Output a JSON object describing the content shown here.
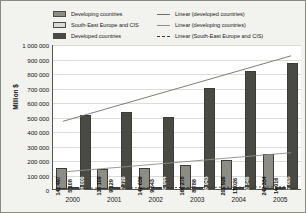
{
  "legend": {
    "left_items": [
      {
        "label": "Developing countries",
        "swatch": "bar-swatch-developing",
        "color": "#8d8d86"
      },
      {
        "label": "South-East Europe and CIS",
        "swatch": "bar-swatch-see-cis",
        "color": "#d9d9d2"
      },
      {
        "label": "Developed countries",
        "swatch": "bar-swatch-developed",
        "color": "#4a4a45"
      }
    ],
    "right_items": [
      {
        "label": "Linear (developed countries)",
        "swatch": "line-swatch-developed",
        "style": "solid",
        "color": "#6e6e68"
      },
      {
        "label": "Linear (developing countries)",
        "swatch": "line-swatch-developing",
        "style": "solid",
        "color": "#8d8d86"
      },
      {
        "label": "Linear (South-East Europe and CIS)",
        "swatch": "line-swatch-see-cis",
        "style": "dashed",
        "color": "#3a3a36"
      }
    ]
  },
  "chart_data": {
    "type": "bar",
    "title": "",
    "xlabel": "",
    "ylabel": "Million $",
    "categories": [
      "2000",
      "2001",
      "2002",
      "2003",
      "2004",
      "2005"
    ],
    "ylim": [
      0,
      1000000
    ],
    "ytick_labels": [
      "1 000 000",
      "900 000",
      "800 000",
      "700 000",
      "600 000",
      "500 000",
      "400 000",
      "300 000",
      "200 000",
      "100 000",
      "0"
    ],
    "ytick_values": [
      1000000,
      900000,
      800000,
      700000,
      600000,
      500000,
      400000,
      300000,
      200000,
      100000,
      0
    ],
    "grid": true,
    "legend_position": "top",
    "series": [
      {
        "name": "Developing countries",
        "color": "#8d8d86",
        "values": [
          141497,
          135109,
          142639,
          166278,
          201926,
          242334
        ],
        "value_labels": [
          "141 497",
          "135 109",
          "142 639",
          "166 278",
          "201 926",
          "242 334"
        ]
      },
      {
        "name": "South-East Europe and CIS",
        "color": "#d9d9d2",
        "values": [
          5108,
          9129,
          9543,
          8788,
          11026,
          14016
        ],
        "value_labels": [
          "5 108",
          "9 129",
          "9 543",
          "8 788",
          "11 026",
          "14 016"
        ]
      },
      {
        "name": "Developed countries",
        "color": "#4a4a45",
        "values": [
          508000,
          527726,
          498944,
          698943,
          810540,
          867805
        ],
        "value_labels": [
          "508 000",
          "527 726",
          "498 944",
          "698 943",
          "810 540",
          "867 805"
        ]
      }
    ],
    "trendlines": [
      {
        "name": "Linear (developed countries)",
        "style": "solid",
        "color": "#6e6e68",
        "start": 470000,
        "end": 925000
      },
      {
        "name": "Linear (developing countries)",
        "style": "solid",
        "color": "#8d8d86",
        "start": 118000,
        "end": 252000
      },
      {
        "name": "Linear (South-East Europe and CIS)",
        "style": "dashed",
        "color": "#3a3a36",
        "start": 4500,
        "end": 15500
      }
    ]
  }
}
